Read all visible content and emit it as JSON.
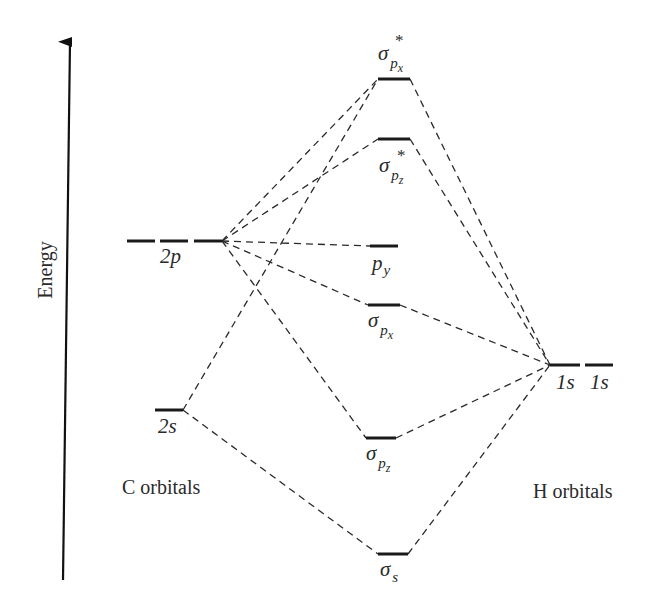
{
  "axis": {
    "label": "Energy",
    "direction": "up"
  },
  "groups": {
    "carbon": {
      "label": "C orbitals"
    },
    "hydrogen": {
      "label": "H orbitals"
    }
  },
  "carbon_orbitals": [
    {
      "id": "2p",
      "label": "2p",
      "count": 3
    },
    {
      "id": "2s",
      "label": "2s",
      "count": 1
    }
  ],
  "hydrogen_orbitals": [
    {
      "id": "1s_a",
      "label": "1s"
    },
    {
      "id": "1s_b",
      "label": "1s"
    }
  ],
  "molecular_orbitals": [
    {
      "id": "sigma_star_px",
      "symbol": "σ",
      "sub": "p",
      "subsub": "x",
      "star": "*",
      "type": "antibonding"
    },
    {
      "id": "sigma_star_pz",
      "symbol": "σ",
      "sub": "p",
      "subsub": "z",
      "star": "*",
      "type": "antibonding"
    },
    {
      "id": "p_y",
      "symbol": "p",
      "sub": "y",
      "type": "nonbonding"
    },
    {
      "id": "sigma_px",
      "symbol": "σ",
      "sub": "p",
      "subsub": "x",
      "type": "bonding"
    },
    {
      "id": "sigma_pz",
      "symbol": "σ",
      "sub": "p",
      "subsub": "z",
      "type": "bonding"
    },
    {
      "id": "sigma_s",
      "symbol": "σ",
      "sub": "s",
      "type": "bonding"
    }
  ],
  "connections": [
    {
      "from": "C 2p",
      "to": "σ*px"
    },
    {
      "from": "C 2p",
      "to": "σ*pz"
    },
    {
      "from": "C 2p",
      "to": "py"
    },
    {
      "from": "C 2p",
      "to": "σpx"
    },
    {
      "from": "C 2p",
      "to": "σpz"
    },
    {
      "from": "C 2s",
      "to": "σ*px"
    },
    {
      "from": "C 2s",
      "to": "σs"
    },
    {
      "from": "H 1s",
      "to": "σ*px"
    },
    {
      "from": "H 1s",
      "to": "σ*pz"
    },
    {
      "from": "H 1s",
      "to": "σpx"
    },
    {
      "from": "H 1s",
      "to": "σpz"
    },
    {
      "from": "H 1s",
      "to": "σs"
    }
  ]
}
